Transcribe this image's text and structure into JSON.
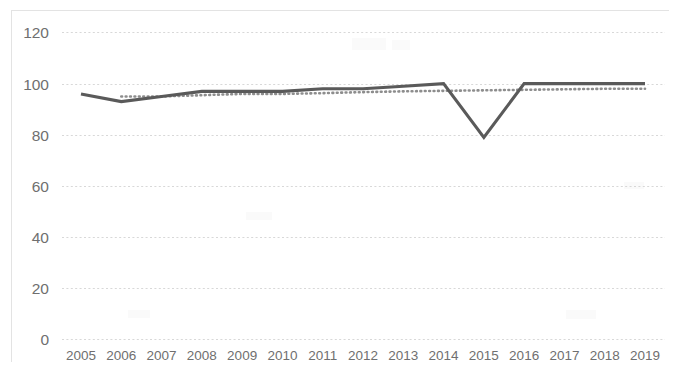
{
  "chart_data": {
    "type": "line",
    "title": "",
    "xlabel": "",
    "ylabel": "",
    "categories": [
      "2005",
      "2006",
      "2007",
      "2008",
      "2009",
      "2010",
      "2011",
      "2012",
      "2013",
      "2014",
      "2015",
      "2016",
      "2017",
      "2018",
      "2019"
    ],
    "ylim": [
      0,
      120
    ],
    "xlim_labels": [
      "2005",
      "2019"
    ],
    "y_ticks": [
      0,
      20,
      40,
      60,
      80,
      100,
      120
    ],
    "y_tick_labels": [
      "0",
      "20",
      "40",
      "60",
      "80",
      "100",
      "120"
    ],
    "grid": true,
    "grid_style": "horizontal-dotted",
    "legend": "none",
    "series": [
      {
        "name": "main",
        "style": "solid",
        "color": "#5a5a5a",
        "values": [
          96,
          93,
          95,
          97,
          97,
          97,
          98,
          98,
          99,
          100,
          79,
          100,
          100,
          100,
          100
        ]
      },
      {
        "name": "trendline",
        "style": "dotted",
        "color": "#8d8d8d",
        "values": [
          null,
          95,
          95,
          95.5,
          96,
          96,
          96.3,
          96.7,
          97,
          97.2,
          97.4,
          97.6,
          97.8,
          98,
          98
        ]
      }
    ]
  },
  "colors": {
    "series_main": "#5a5a5a",
    "series_trend": "#8d8d8d",
    "gridline": "#d6d6d6",
    "tick_text": "#6f6f6f",
    "background": "#ffffff",
    "plot_border": "#e3e3e3"
  }
}
